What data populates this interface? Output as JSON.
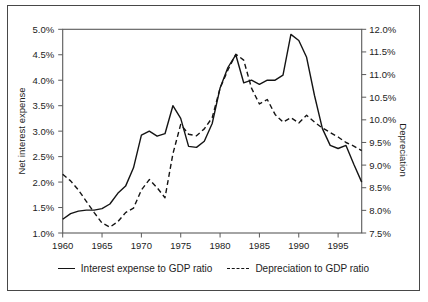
{
  "chart_data": {
    "type": "line",
    "years": [
      1960,
      1961,
      1962,
      1963,
      1964,
      1965,
      1966,
      1967,
      1968,
      1969,
      1970,
      1971,
      1972,
      1973,
      1974,
      1975,
      1976,
      1977,
      1978,
      1979,
      1980,
      1981,
      1982,
      1983,
      1984,
      1985,
      1986,
      1987,
      1988,
      1989,
      1990,
      1991,
      1992,
      1993,
      1994,
      1995,
      1996,
      1997,
      1998
    ],
    "series": [
      {
        "name": "Interest expense to GDP ratio",
        "axis": "left",
        "style": "solid",
        "color": "#141414",
        "values": [
          1.27,
          1.38,
          1.43,
          1.45,
          1.45,
          1.48,
          1.57,
          1.78,
          1.92,
          2.28,
          2.92,
          3.0,
          2.9,
          2.95,
          3.5,
          3.25,
          2.7,
          2.68,
          2.8,
          3.15,
          3.85,
          4.25,
          4.5,
          3.95,
          4.0,
          3.92,
          4.0,
          4.0,
          4.1,
          4.9,
          4.78,
          4.45,
          3.7,
          3.05,
          2.72,
          2.66,
          2.72,
          2.35,
          2.0
        ]
      },
      {
        "name": "Depreciation to GDP ratio",
        "axis": "right",
        "style": "dashed",
        "color": "#141414",
        "values": [
          8.8,
          8.65,
          8.45,
          8.2,
          7.95,
          7.72,
          7.63,
          7.75,
          7.95,
          8.05,
          8.45,
          8.68,
          8.5,
          8.28,
          9.25,
          9.9,
          9.68,
          9.65,
          9.8,
          10.05,
          10.7,
          11.1,
          11.45,
          11.32,
          10.7,
          10.35,
          10.45,
          10.12,
          9.95,
          10.05,
          9.93,
          10.1,
          9.95,
          9.82,
          9.72,
          9.62,
          9.5,
          9.42,
          9.32
        ]
      }
    ],
    "left_axis": {
      "title": "Net interest expense",
      "min": 1.0,
      "max": 5.0,
      "ticks": [
        "5.0%",
        "4.5%",
        "4.0%",
        "3.5%",
        "3.0%",
        "2.5%",
        "2.0%",
        "1.5%",
        "1.0%"
      ]
    },
    "right_axis": {
      "title": "Depreciation",
      "min": 7.5,
      "max": 12.0,
      "ticks": [
        "12.0%",
        "11.5%",
        "11.0%",
        "10.5%",
        "10.0%",
        "9.5%",
        "9.0%",
        "8.5%",
        "8.0%",
        "7.5%"
      ]
    },
    "x_axis": {
      "min": 1960,
      "max": 1998,
      "ticks": [
        "1960",
        "1965",
        "1970",
        "1975",
        "1980",
        "1985",
        "1990",
        "1995"
      ]
    },
    "legend": {
      "items": [
        "Interest expense to GDP ratio",
        "Depreciation to GDP ratio"
      ],
      "position": "bottom-center"
    },
    "grid": false
  }
}
